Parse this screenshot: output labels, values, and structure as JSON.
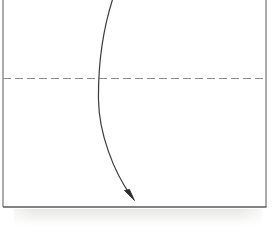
{
  "figure": {
    "title": "Scanned line drawing: rectangular frame with dashed centerline and curved arrow",
    "background_color": "#ffffff",
    "width": 272,
    "height": 232,
    "labels": [],
    "annotations": []
  },
  "frame": {
    "name": "rectangular-border",
    "stroke_color": "#5c5c5c",
    "stroke_width": 1.1,
    "left_x": 3,
    "right_x": 266,
    "top_y": 0,
    "bottom_y": 207,
    "top_edge_visible": false,
    "left_edge_visible": true,
    "right_edge_visible": true,
    "bottom_edge_visible": true
  },
  "dashed_centerline": {
    "name": "horizontal-dashed-centerline",
    "stroke_color": "#8a8a8a",
    "stroke_width": 1.1,
    "y": 78,
    "x_start": 3,
    "x_end": 266,
    "dash_length": 8,
    "gap_length": 4
  },
  "curved_arrow": {
    "name": "curved-arrow",
    "stroke_color": "#3a3a3a",
    "stroke_width": 1.2,
    "start_point": [
      113,
      0
    ],
    "inflection_point": [
      98,
      100
    ],
    "end_point": [
      133,
      198
    ],
    "arrowhead": {
      "tip": [
        134,
        199
      ],
      "length": 11,
      "width": 6,
      "filled": true,
      "color": "#2b2b2b"
    },
    "crosses_centerline_at_x": 100
  },
  "paper_shadow": {
    "name": "paper-bottom-shadow",
    "top_y": 209,
    "bottom_y": 228,
    "left_x": 18,
    "right_x": 258,
    "color": "#ededeb"
  }
}
